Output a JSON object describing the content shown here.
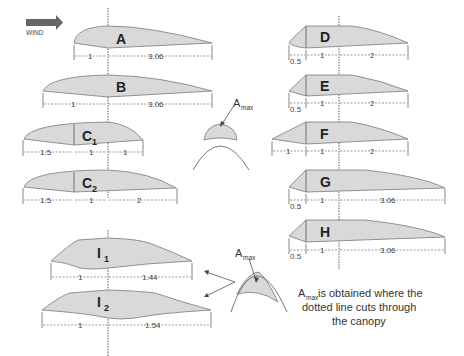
{
  "wind": {
    "label": "WIND",
    "icon": "arrow-right-icon"
  },
  "canopies": {
    "A": {
      "label": "A",
      "dims": [
        "1",
        "3.06"
      ]
    },
    "B": {
      "label": "B",
      "dims": [
        "1",
        "3.06"
      ]
    },
    "C1": {
      "label": "C",
      "sub": "1",
      "dims": [
        "1.5",
        "1",
        "1"
      ]
    },
    "C2": {
      "label": "C",
      "sub": "2",
      "dims": [
        "1.5",
        "1",
        "2"
      ]
    },
    "D": {
      "label": "D",
      "dims": [
        "0.5",
        "1",
        "2"
      ]
    },
    "E": {
      "label": "E",
      "dims": [
        "0.5",
        "1",
        "2"
      ]
    },
    "F": {
      "label": "F",
      "dims": [
        "1",
        "1",
        "2"
      ]
    },
    "G": {
      "label": "G",
      "dims": [
        "0.5",
        "1",
        "3.06"
      ]
    },
    "H": {
      "label": "H",
      "dims": [
        "0.5",
        "1",
        "3.06"
      ]
    },
    "I1": {
      "label": "I",
      "sub": "1",
      "dims": [
        "1",
        "1.44"
      ]
    },
    "I2": {
      "label": "I",
      "sub": "2",
      "dims": [
        "1",
        "1.54"
      ]
    }
  },
  "amax": {
    "label": "A",
    "sub": "max"
  },
  "note": {
    "line1_suffix": " is obtained where the",
    "line2": "dotted line cuts through",
    "line3": "the canopy"
  }
}
